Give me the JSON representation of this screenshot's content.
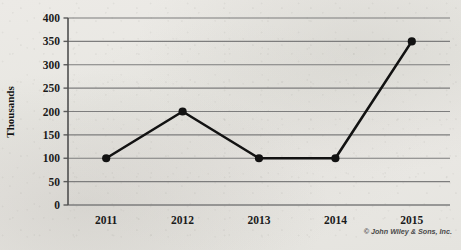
{
  "chart_data": {
    "type": "line",
    "title": "",
    "xlabel": "",
    "ylabel": "Thousands",
    "categories": [
      "2011",
      "2012",
      "2013",
      "2014",
      "2015"
    ],
    "values": [
      100,
      200,
      100,
      100,
      350
    ],
    "series": [
      {
        "name": "",
        "values": [
          100,
          200,
          100,
          100,
          350
        ]
      }
    ],
    "ylim": [
      0,
      400
    ],
    "ytick_labels": [
      "0",
      "50",
      "100",
      "150",
      "200",
      "250",
      "300",
      "350",
      "400"
    ],
    "ytick_values": [
      0,
      50,
      100,
      150,
      200,
      250,
      300,
      350,
      400
    ],
    "grid": true,
    "grid_axis": "y",
    "legend": false,
    "legend_position": "none",
    "markers": true,
    "marker_shape": "circle",
    "line_color": "#121212",
    "marker_color": "#121212",
    "grid_color": "#7d7d7d",
    "axis_color": "#5a5a5a"
  },
  "credit": {
    "text": "© John Wiley & Sons, Inc."
  },
  "background": {
    "ghost_top": "",
    "ghost_mid": "",
    "ghost_bottom": "",
    "paper_color": "#e9e8e4"
  }
}
